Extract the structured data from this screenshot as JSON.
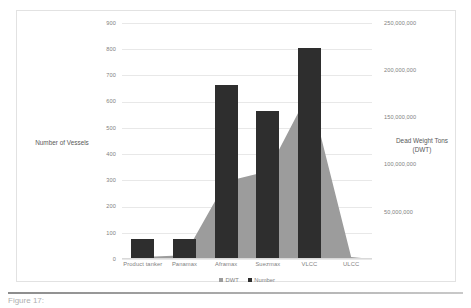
{
  "chart_data": {
    "type": "bar",
    "title": "",
    "categories": [
      "Product tanker",
      "Panamax",
      "Aframax",
      "Suezmax",
      "VLCC",
      "ULCC"
    ],
    "series": [
      {
        "name": "DWT",
        "type": "area",
        "axis": "right",
        "color": "#9c9c9c",
        "values": [
          2000000,
          4000000,
          82000000,
          93000000,
          178000000,
          2000000
        ]
      },
      {
        "name": "Number",
        "type": "bar",
        "axis": "left",
        "color": "#2e2e2e",
        "values": [
          78,
          78,
          665,
          565,
          805,
          3
        ]
      }
    ],
    "xlabel": "",
    "ylabel_left": "Number of Vessels",
    "ylabel_right": "Dead Weight Tons (DWT)",
    "ylim_left": [
      0,
      900
    ],
    "ylim_right": [
      0,
      250000000
    ],
    "yticks_left": [
      0,
      100,
      200,
      300,
      400,
      500,
      600,
      700,
      800,
      900
    ],
    "yticks_left_labels": [
      "0",
      "100",
      "200",
      "300",
      "400",
      "500",
      "600",
      "700",
      "800",
      "900"
    ],
    "yticks_right": [
      0,
      50000000,
      100000000,
      150000000,
      200000000,
      250000000
    ],
    "yticks_right_labels": [
      "",
      "50,000,000",
      "100,000,000",
      "150,000,000",
      "200,000,000",
      "250,000,000"
    ],
    "grid": true,
    "legend_position": "bottom",
    "legend": [
      "DWT",
      "Number"
    ]
  },
  "axis_titles": {
    "left": "Number of Vessels",
    "right": "Dead Weight Tons (DWT)"
  },
  "legend": {
    "items": [
      {
        "label": "DWT",
        "color": "#9c9c9c"
      },
      {
        "label": "Number",
        "color": "#2e2e2e"
      }
    ]
  },
  "caption": {
    "text": "Figure 17:"
  },
  "colors": {
    "bar": "#2e2e2e",
    "area": "#9c9c9c",
    "grid": "#e8e8e8",
    "text": "#7f7f7f",
    "border": "#e2e2e2"
  }
}
